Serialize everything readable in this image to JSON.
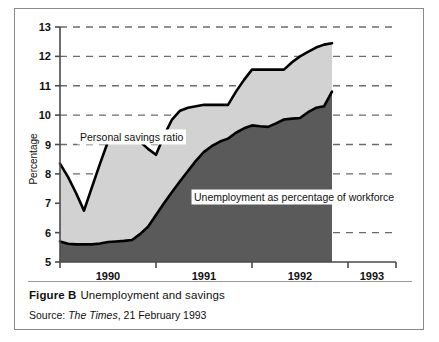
{
  "figure": {
    "caption_label": "Figure B",
    "caption_text": "Unemployment and savings",
    "source_label": "Source:",
    "source_publication": "The Times",
    "source_date": ", 21 February 1993"
  },
  "colors": {
    "savings_fill": "#d2d2d2",
    "unemployment_fill": "#5a5a5a",
    "line": "#000000",
    "grid": "#6b6b6b",
    "axis": "#4a4a4a",
    "frame": "#8a8a8a",
    "background": "#ffffff"
  },
  "chart_data": {
    "type": "area",
    "title": "Unemployment and savings",
    "xlabel": "",
    "ylabel": "Percentage",
    "ylim": [
      5,
      13
    ],
    "yticks": [
      5,
      6,
      7,
      8,
      9,
      10,
      11,
      12,
      13
    ],
    "ytick_labels": [
      "5",
      "6",
      "7",
      "8",
      "9",
      "10",
      "11",
      "12",
      "13"
    ],
    "xlim": [
      1989.75,
      1993.25
    ],
    "xticks": [
      1989.75,
      1990.75,
      1991.75,
      1992.75,
      1993.25
    ],
    "xtick_labels": [
      "1990",
      "1991",
      "1992",
      "1993"
    ],
    "xtick_label_positions": [
      1990.25,
      1991.25,
      1992.25,
      1993.0
    ],
    "grid": true,
    "grid_style": "dashed-horizontal",
    "legend": "in-plot-labels",
    "x": [
      1989.75,
      1989.833,
      1989.917,
      1990.0,
      1990.083,
      1990.167,
      1990.25,
      1990.333,
      1990.417,
      1990.5,
      1990.583,
      1990.667,
      1990.75,
      1990.833,
      1990.917,
      1991.0,
      1991.083,
      1991.167,
      1991.25,
      1991.333,
      1991.417,
      1991.5,
      1991.583,
      1991.667,
      1991.75,
      1991.833,
      1991.917,
      1992.0,
      1992.083,
      1992.167,
      1992.25,
      1992.333,
      1992.417,
      1992.5,
      1992.583
    ],
    "series": [
      {
        "name": "Personal savings ratio",
        "label": "Personal savings ratio",
        "fill": "#d2d2d2",
        "values": [
          8.35,
          7.9,
          7.35,
          6.75,
          7.55,
          8.35,
          9.1,
          9.15,
          9.2,
          9.3,
          9.1,
          8.85,
          8.65,
          9.3,
          9.85,
          10.15,
          10.25,
          10.3,
          10.35,
          10.35,
          10.35,
          10.35,
          10.8,
          11.2,
          11.55,
          11.55,
          11.55,
          11.55,
          11.55,
          11.8,
          12.0,
          12.15,
          12.3,
          12.4,
          12.45
        ]
      },
      {
        "name": "Unemployment as percentage of workforce",
        "label": "Unemployment as percentage of workforce",
        "fill": "#5a5a5a",
        "values": [
          5.7,
          5.62,
          5.6,
          5.6,
          5.6,
          5.63,
          5.68,
          5.7,
          5.72,
          5.75,
          5.95,
          6.2,
          6.6,
          7.0,
          7.38,
          7.75,
          8.1,
          8.45,
          8.75,
          8.95,
          9.1,
          9.2,
          9.4,
          9.55,
          9.65,
          9.62,
          9.6,
          9.72,
          9.85,
          9.88,
          9.9,
          10.1,
          10.25,
          10.3,
          10.8
        ]
      }
    ]
  },
  "annotations": [
    {
      "name": "savings-label",
      "text": "Personal savings ratio",
      "x_px": 62,
      "y_px": 123
    },
    {
      "name": "unemployment-label",
      "text": "Unemployment as percentage of workforce",
      "x_px": 176,
      "y_px": 183
    }
  ]
}
